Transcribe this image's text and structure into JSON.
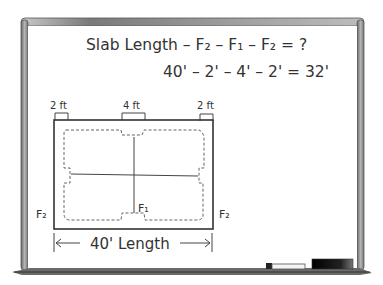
{
  "whiteboard": {
    "equation_line1": "Slab Length – F₂ – F₁ – F₂ = ?",
    "equation_line2": "40' – 2' – 4' – 2' = 32'"
  },
  "diagram": {
    "dim_left": "2 ft",
    "dim_center": "4 ft",
    "dim_right": "2 ft",
    "label_f2_left": "F₂",
    "label_f1": "F₁",
    "label_f2_right": "F₂",
    "length_label": "40' Length"
  },
  "colors": {
    "frame": "#8a8a8a",
    "ink": "#333333",
    "eraser": "#111111",
    "marker": "#f4f4f4"
  }
}
